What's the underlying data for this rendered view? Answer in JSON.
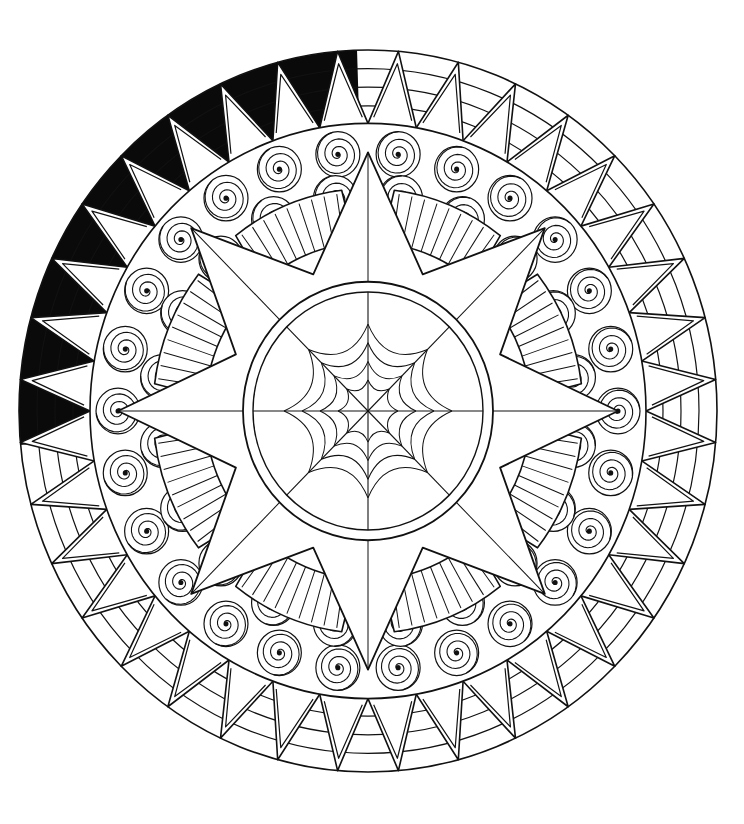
{
  "image": {
    "description": "Black and white mandala coloring page",
    "width": 744,
    "height": 824,
    "colors": {
      "line": "#111111",
      "fill": "#ffffff",
      "shaded": "#0a0a0a"
    },
    "geometry": {
      "cx": 368,
      "cy": 411,
      "outer_rx": 349,
      "outer_ry": 361,
      "zigzag_inner_r": 278,
      "swirl_band_inner_r": 200,
      "center_circle_r": 125,
      "zigzag_points": 36,
      "star_points": 8
    },
    "elements": [
      "outer-ring-zigzag",
      "shaded-arc-upper-left",
      "swirl-band",
      "eight-point-star",
      "sunray-fans",
      "center-circle",
      "spider-web"
    ]
  }
}
